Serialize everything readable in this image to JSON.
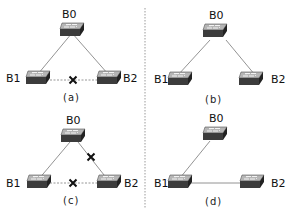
{
  "nodes": {
    "b0": "B0",
    "b1": "B1",
    "b2": "B2"
  },
  "panels": [
    {
      "id": "a",
      "caption": "(a)",
      "links": [
        {
          "from": "B0",
          "to": "B1",
          "state": "active"
        },
        {
          "from": "B0",
          "to": "B2",
          "state": "active"
        },
        {
          "from": "B1",
          "to": "B2",
          "state": "blocked"
        }
      ]
    },
    {
      "id": "b",
      "caption": "(b)",
      "links": [
        {
          "from": "B0",
          "to": "B1",
          "state": "active"
        },
        {
          "from": "B0",
          "to": "B2",
          "state": "active"
        }
      ]
    },
    {
      "id": "c",
      "caption": "(c)",
      "links": [
        {
          "from": "B0",
          "to": "B1",
          "state": "active"
        },
        {
          "from": "B0",
          "to": "B2",
          "state": "failed"
        },
        {
          "from": "B1",
          "to": "B2",
          "state": "blocked"
        }
      ]
    },
    {
      "id": "d",
      "caption": "(d)",
      "links": [
        {
          "from": "B0",
          "to": "B1",
          "state": "active"
        },
        {
          "from": "B1",
          "to": "B2",
          "state": "active"
        }
      ]
    }
  ],
  "colors": {
    "link": "#777777",
    "dashed": "#8a8a8a",
    "cross": "#111111",
    "switch_top": "#9a9a9a",
    "switch_side": "#3a3a3a"
  }
}
